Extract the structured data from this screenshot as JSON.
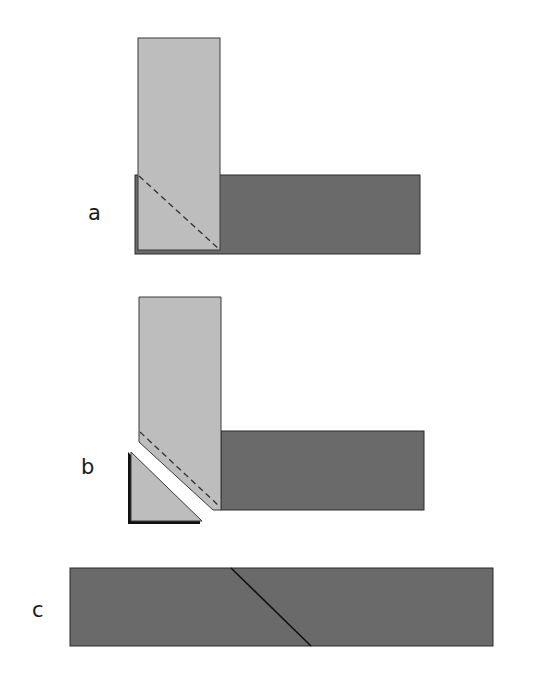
{
  "colors": {
    "light_strip": "#bdbdbd",
    "dark_strip": "#6a6a6a",
    "outline": "#2a2a2a",
    "shadow_edge": "#111111",
    "background": "#ffffff"
  },
  "panels": [
    {
      "label": "a",
      "label_pos": {
        "x": 88,
        "y": 203
      },
      "description": "Light strip laid perpendicular over dark strip end, with dashed diagonal fold line"
    },
    {
      "label": "b",
      "label_pos": {
        "x": 81,
        "y": 457
      },
      "description": "Corner triangle cut away along the diagonal, separated from the strips"
    },
    {
      "label": "c",
      "label_pos": {
        "x": 32,
        "y": 600
      },
      "description": "Resulting joined strip with diagonal seam"
    }
  ]
}
